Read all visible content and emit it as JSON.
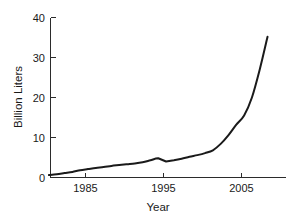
{
  "chart_data": {
    "type": "line",
    "title": "",
    "xlabel": "Year",
    "ylabel": "Billion Liters",
    "xlim": [
      1981,
      1991
    ],
    "ylim": [
      0,
      40
    ],
    "grid": false,
    "legend": null,
    "xticks": [
      1985,
      1995,
      2005
    ],
    "xtick_labels": [
      "1985",
      "1995",
      "2005"
    ],
    "yticks": [
      0,
      10,
      20,
      30,
      40
    ],
    "ytick_labels": [
      "0",
      "10",
      "20",
      "30",
      "40"
    ],
    "x_axis_range": [
      1981.2,
      2011.3
    ],
    "series": [
      {
        "name": "World fuel ethanol production",
        "color": "#1a1a1a",
        "x": [
          1981,
          1982,
          1983,
          1984,
          1985,
          1986,
          1987,
          1988,
          1989,
          1990,
          1991,
          1992,
          1993,
          1994,
          1995,
          1996,
          1997,
          1998,
          1999,
          2000,
          2001,
          2002,
          2003,
          2004,
          2005,
          2006,
          2007,
          2008,
          2009
        ],
        "y": [
          0.6,
          0.8,
          1.1,
          1.4,
          1.8,
          2.1,
          2.4,
          2.6,
          2.9,
          3.1,
          3.3,
          3.5,
          3.8,
          4.3,
          4.8,
          4.0,
          4.3,
          4.7,
          5.2,
          5.6,
          6.1,
          6.8,
          8.4,
          10.6,
          13.2,
          15.5,
          20.0,
          27.0,
          35.2
        ]
      }
    ],
    "annotations": [
      {
        "label": "dip",
        "x": 1996,
        "y": 4.0
      },
      {
        "label": "steep-rise-onset",
        "x": 2002,
        "y": 6.8
      },
      {
        "label": "series-end",
        "x": 2009,
        "y": 35.2
      }
    ]
  },
  "axes": {
    "y_axis_title": "Billion Liters",
    "x_axis_title": "Year"
  }
}
